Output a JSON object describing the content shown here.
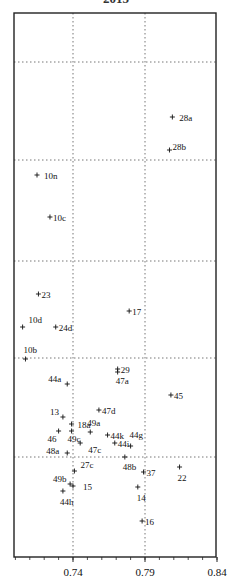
{
  "chart_data": {
    "type": "scatter",
    "title": "2015",
    "xlabel": "",
    "ylabel": "",
    "xlim": [
      0.699,
      0.84
    ],
    "x_ticks": [
      "0.74",
      "0.79",
      "0.84"
    ],
    "x_tick_values": [
      0.74,
      0.79,
      0.84
    ],
    "grid": true,
    "grid_style": "dotted",
    "legend": false,
    "y_axis_labels_visible": false,
    "note": "y positions are given in pixel rows since y-axis is unlabeled",
    "points": [
      {
        "label": "28a",
        "x": 0.809,
        "y_px": 117,
        "lx": 4,
        "ly": 4
      },
      {
        "label": "28b",
        "x": 0.807,
        "y_px": 150,
        "lx": 0,
        "ly": 0
      },
      {
        "label": "10n",
        "x": 0.715,
        "y_px": 175,
        "lx": 4,
        "ly": 4
      },
      {
        "label": "10c",
        "x": 0.724,
        "y_px": 217,
        "lx": 0,
        "ly": 4
      },
      {
        "label": "23",
        "x": 0.716,
        "y_px": 294,
        "lx": 0,
        "ly": 4
      },
      {
        "label": "10d",
        "x": 0.705,
        "y_px": 327,
        "lx": 3,
        "ly": -4
      },
      {
        "label": "24d",
        "x": 0.728,
        "y_px": 327,
        "lx": 0,
        "ly": 4
      },
      {
        "label": "17",
        "x": 0.779,
        "y_px": 311,
        "lx": 0,
        "ly": 4
      },
      {
        "label": "10b",
        "x": 0.707,
        "y_px": 359,
        "lx": -5,
        "ly": -6
      },
      {
        "label": "29",
        "x": 0.771,
        "y_px": 369,
        "lx": 0,
        "ly": 4
      },
      {
        "label": "47a",
        "x": 0.771,
        "y_px": 372,
        "lx": -5,
        "ly": 12
      },
      {
        "label": "44a",
        "x": 0.736,
        "y_px": 384,
        "lx": -22,
        "ly": -2
      },
      {
        "label": "45",
        "x": 0.808,
        "y_px": 395,
        "lx": 0,
        "ly": 4
      },
      {
        "label": "47d",
        "x": 0.758,
        "y_px": 410,
        "lx": 0,
        "ly": 4
      },
      {
        "label": "13",
        "x": 0.733,
        "y_px": 417,
        "lx": -16,
        "ly": -2
      },
      {
        "label": "18a",
        "x": 0.739,
        "y_px": 424,
        "lx": 3,
        "ly": 4
      },
      {
        "label": "49a",
        "x": 0.752,
        "y_px": 432,
        "lx": -6,
        "ly": -6
      },
      {
        "label": "44k",
        "x": 0.764,
        "y_px": 435,
        "lx": 0,
        "ly": 4
      },
      {
        "label": "46",
        "x": 0.73,
        "y_px": 431,
        "lx": -14,
        "ly": 11
      },
      {
        "label": "49c",
        "x": 0.739,
        "y_px": 431,
        "lx": -7,
        "ly": 11
      },
      {
        "label": "44i",
        "x": 0.769,
        "y_px": 443,
        "lx": 0,
        "ly": 4
      },
      {
        "label": "44g",
        "x": 0.78,
        "y_px": 446,
        "lx": -4,
        "ly": -8
      },
      {
        "label": "47c",
        "x": 0.745,
        "y_px": 443,
        "lx": 5,
        "ly": 10
      },
      {
        "label": "48a",
        "x": 0.736,
        "y_px": 453,
        "lx": -24,
        "ly": 1
      },
      {
        "label": "48b",
        "x": 0.776,
        "y_px": 457,
        "lx": -5,
        "ly": 13
      },
      {
        "label": "27c",
        "x": 0.741,
        "y_px": 471,
        "lx": 3,
        "ly": -3
      },
      {
        "label": "37",
        "x": 0.789,
        "y_px": 472,
        "lx": 0,
        "ly": 4
      },
      {
        "label": "22",
        "x": 0.814,
        "y_px": 467,
        "lx": -5,
        "ly": 14
      },
      {
        "label": "49b",
        "x": 0.738,
        "y_px": 484,
        "lx": -20,
        "ly": -2
      },
      {
        "label": "15",
        "x": 0.74,
        "y_px": 486,
        "lx": 7,
        "ly": 4
      },
      {
        "label": "14",
        "x": 0.785,
        "y_px": 487,
        "lx": -4,
        "ly": 14
      },
      {
        "label": "44h",
        "x": 0.733,
        "y_px": 491,
        "lx": -6,
        "ly": 14
      },
      {
        "label": "16",
        "x": 0.788,
        "y_px": 521,
        "lx": 0,
        "ly": 4
      }
    ],
    "h_gridlines_px": [
      62,
      160,
      261,
      358,
      457
    ]
  },
  "colors": {
    "axis": "#222222",
    "grid": "#777777",
    "marker": "#111111"
  }
}
